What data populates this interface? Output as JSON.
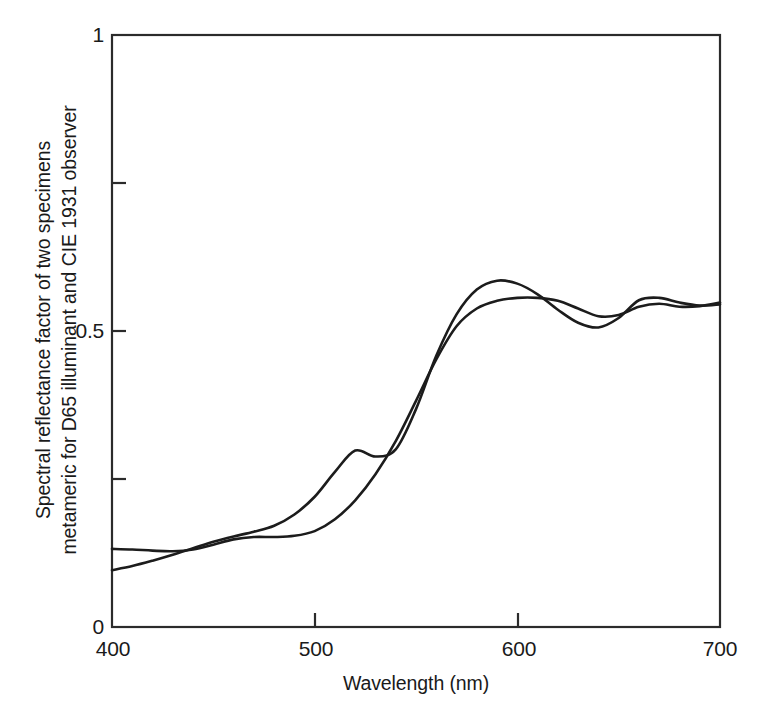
{
  "chart_data": {
    "type": "line",
    "title": "",
    "xlabel": "Wavelength (nm)",
    "ylabel_line1": "Spectral reflectance factor of two specimens",
    "ylabel_line2": "metameric for D65 illuminant and CIE 1931 observer",
    "xlim": [
      400,
      700
    ],
    "ylim": [
      0,
      1
    ],
    "xticks": [
      400,
      500,
      600,
      700
    ],
    "xtick_labels": [
      "400",
      "500",
      "600",
      "700"
    ],
    "yticks": [
      0,
      0.25,
      0.5,
      0.75,
      1
    ],
    "ytick_labels": [
      "0",
      "",
      "0.5",
      "",
      "1"
    ],
    "grid": false,
    "legend": "none",
    "line_color": "#1c1c1c",
    "frame_color": "#2b2b2b",
    "background": "#ffffff",
    "x": [
      400,
      410,
      420,
      430,
      440,
      450,
      460,
      470,
      480,
      490,
      500,
      510,
      520,
      530,
      540,
      550,
      560,
      570,
      580,
      590,
      600,
      610,
      620,
      630,
      640,
      650,
      660,
      670,
      680,
      690,
      700
    ],
    "series": [
      {
        "name": "Specimen 1",
        "values": [
          0.132,
          0.131,
          0.129,
          0.128,
          0.131,
          0.139,
          0.148,
          0.152,
          0.152,
          0.154,
          0.162,
          0.182,
          0.214,
          0.258,
          0.314,
          0.382,
          0.452,
          0.508,
          0.538,
          0.551,
          0.556,
          0.556,
          0.551,
          0.538,
          0.525,
          0.527,
          0.541,
          0.546,
          0.541,
          0.542,
          0.548
        ]
      },
      {
        "name": "Specimen 2",
        "values": [
          0.096,
          0.103,
          0.112,
          0.122,
          0.133,
          0.144,
          0.153,
          0.161,
          0.171,
          0.19,
          0.22,
          0.262,
          0.298,
          0.288,
          0.3,
          0.368,
          0.458,
          0.528,
          0.57,
          0.585,
          0.58,
          0.562,
          0.536,
          0.514,
          0.506,
          0.522,
          0.552,
          0.556,
          0.548,
          0.543,
          0.545
        ]
      }
    ]
  },
  "axes": {
    "y_tick_1": "1",
    "y_tick_05": "0.5",
    "y_tick_0": "0",
    "x_tick_400": "400",
    "x_tick_500": "500",
    "x_tick_600": "600",
    "x_tick_700": "700"
  }
}
